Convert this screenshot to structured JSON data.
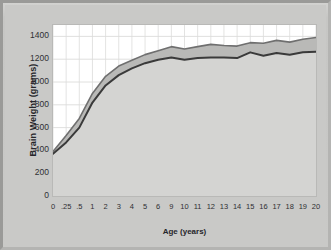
{
  "chart_data": {
    "type": "area",
    "title": "",
    "xlabel": "Age (years)",
    "ylabel": "Brain Weight (grams)",
    "xlim": [
      0,
      20
    ],
    "ylim": [
      0,
      1500
    ],
    "grid": true,
    "legend": "none",
    "y_ticks": [
      0,
      200,
      400,
      600,
      800,
      1000,
      1200,
      1400
    ],
    "x_ticks": [
      "0",
      ".25",
      ".5",
      "1",
      "2",
      "3",
      "4",
      "5",
      "6",
      "9",
      "10",
      "11",
      "12",
      "13",
      "14",
      "15",
      "16",
      "17",
      "18",
      "19",
      "20"
    ],
    "x_positions": [
      0,
      0.25,
      0.5,
      1,
      2,
      3,
      4,
      5,
      6,
      9,
      10,
      11,
      12,
      13,
      14,
      15,
      16,
      17,
      18,
      19,
      20
    ],
    "categories": [
      "0",
      ".25",
      ".5",
      "1",
      "2",
      "3",
      "4",
      "5",
      "6",
      "9",
      "10",
      "11",
      "12",
      "13",
      "14",
      "15",
      "16",
      "17",
      "18",
      "19",
      "20"
    ],
    "series": [
      {
        "name": "Upper band (male brain weight)",
        "color": "#6f6f6f",
        "values": [
          390,
          530,
          680,
          900,
          1050,
          1140,
          1190,
          1240,
          1275,
          1310,
          1290,
          1310,
          1330,
          1320,
          1315,
          1345,
          1340,
          1365,
          1350,
          1375,
          1390
        ]
      },
      {
        "name": "Lower band (female brain weight)",
        "color": "#3a3a3a",
        "values": [
          370,
          470,
          600,
          820,
          970,
          1060,
          1120,
          1165,
          1195,
          1215,
          1195,
          1210,
          1215,
          1215,
          1210,
          1260,
          1230,
          1255,
          1240,
          1260,
          1265
        ]
      }
    ],
    "band_fill": "#b9b9b7",
    "area_fill": "#d4d4d2",
    "plot_background": "#ffffff"
  },
  "axes": {
    "y_title": "Brain Weight (grams)",
    "x_title": "Age (years)"
  },
  "figure": {
    "frame_color": "#c9c9c7",
    "border_color": "#9a9a98"
  }
}
